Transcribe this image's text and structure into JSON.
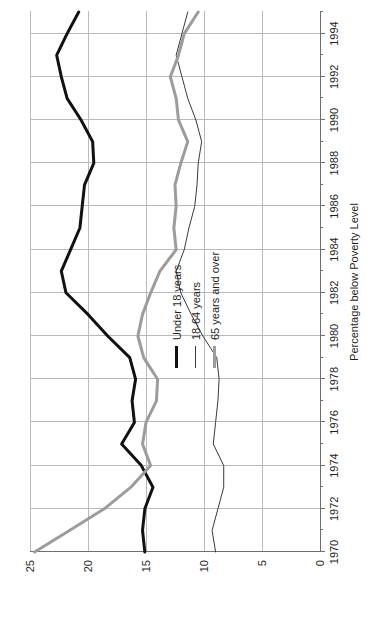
{
  "chart_data": {
    "type": "line",
    "title": "",
    "xlabel": "",
    "ylabel": "Percentage below Poverty Level",
    "orientation": "rotated-90-ccw",
    "grid": true,
    "legend_position": "inside-right",
    "xlim": [
      1970,
      1995
    ],
    "ylim": [
      0,
      25
    ],
    "yticks": [
      0,
      5,
      10,
      15,
      20,
      25
    ],
    "ytick_labels": [
      "0",
      "5",
      "10",
      "15",
      "20",
      "25"
    ],
    "x": [
      1970,
      1971,
      1972,
      1973,
      1974,
      1975,
      1976,
      1977,
      1978,
      1979,
      1980,
      1981,
      1982,
      1983,
      1984,
      1985,
      1986,
      1987,
      1988,
      1989,
      1990,
      1991,
      1992,
      1993,
      1994,
      1995
    ],
    "xticks": [
      1970,
      1972,
      1974,
      1976,
      1978,
      1980,
      1982,
      1984,
      1986,
      1988,
      1990,
      1992,
      1994
    ],
    "xtick_labels": [
      "1970",
      "1972",
      "1974",
      "1976",
      "1978",
      "1980",
      "1982",
      "1984",
      "1986",
      "1988",
      "1990",
      "1992",
      "1994"
    ],
    "xminor_ticks": [
      1971,
      1973,
      1975,
      1977,
      1979,
      1981,
      1983,
      1985,
      1987,
      1989,
      1991,
      1993,
      1995
    ],
    "series": [
      {
        "name": "Under 18 years",
        "color": "#111111",
        "width": 3,
        "values": [
          15.1,
          15.3,
          15.1,
          14.4,
          15.4,
          17.1,
          16.0,
          16.2,
          15.9,
          16.4,
          18.3,
          20.0,
          21.9,
          22.3,
          21.5,
          20.7,
          20.5,
          20.3,
          19.5,
          19.6,
          20.6,
          21.8,
          22.3,
          22.7,
          21.8,
          20.8
        ]
      },
      {
        "name": "18-64 years",
        "color": "#3a3a3a",
        "width": 1,
        "values": [
          9.0,
          9.3,
          8.8,
          8.3,
          8.3,
          9.2,
          9.0,
          8.8,
          8.7,
          8.9,
          10.1,
          11.1,
          12.0,
          12.4,
          11.7,
          11.3,
          10.8,
          10.6,
          10.5,
          10.2,
          10.7,
          11.4,
          11.9,
          12.4,
          11.9,
          11.4
        ]
      },
      {
        "name": "65 years and over",
        "color": "#9c9c9c",
        "width": 3,
        "values": [
          24.6,
          21.6,
          18.6,
          16.3,
          14.6,
          15.3,
          15.0,
          14.1,
          14.0,
          15.2,
          15.7,
          15.3,
          14.6,
          13.8,
          12.4,
          12.6,
          12.4,
          12.5,
          12.0,
          11.4,
          12.2,
          12.4,
          12.9,
          12.2,
          11.7,
          10.5
        ]
      }
    ],
    "legend": [
      {
        "label": "Under 18 years",
        "style": "thick-black"
      },
      {
        "label": "18-64 years",
        "style": "thin-black"
      },
      {
        "label": "65 years and over",
        "style": "thick-gray"
      }
    ]
  },
  "colors": {
    "under18": "#111111",
    "age1864": "#3a3a3a",
    "age65plus": "#9c9c9c",
    "grid": "#b9b9b9",
    "axis": "#6f6f6f",
    "background": "#ffffff"
  }
}
